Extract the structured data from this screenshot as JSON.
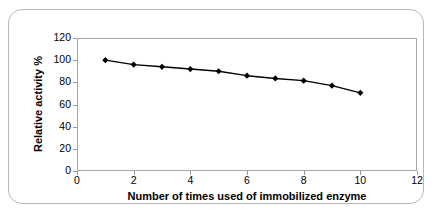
{
  "chart_data": {
    "type": "line",
    "title": "",
    "xlabel": "Number of times used of immobilized enzyme",
    "ylabel": "Relative activity %",
    "x": [
      1,
      2,
      3,
      4,
      5,
      6,
      7,
      8,
      9,
      10
    ],
    "values": [
      100,
      96,
      94,
      92,
      90,
      86,
      83.5,
      81.5,
      77,
      70.5
    ],
    "series": [
      {
        "name": "Relative activity %",
        "values": [
          100,
          96,
          94,
          92,
          90,
          86,
          83.5,
          81.5,
          77,
          70.5
        ]
      }
    ],
    "xlim": [
      0,
      12
    ],
    "ylim": [
      0,
      120
    ],
    "xticks": [
      0,
      2,
      4,
      6,
      8,
      10,
      12
    ],
    "yticks": [
      0,
      20,
      40,
      60,
      80,
      100,
      120
    ],
    "xtick_labels": [
      "0",
      "2",
      "4",
      "6",
      "8",
      "10",
      "12"
    ],
    "ytick_labels": [
      "0",
      "20",
      "40",
      "60",
      "80",
      "100",
      "120"
    ],
    "grid": false,
    "legend": false,
    "legend_position": "none",
    "marker": "diamond",
    "line_color": "#000000",
    "marker_color": "#000000",
    "plot_border_color": "#a6a6a6",
    "frame_border_color": "#b9b9b9",
    "background_color": "#ffffff",
    "annotations": []
  }
}
